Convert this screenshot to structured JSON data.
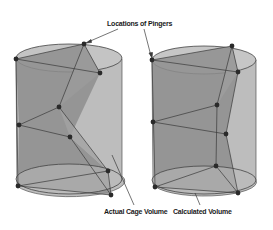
{
  "figure": {
    "labels": {
      "pingers": "Locations of Pingers",
      "actual": "Actual Cage Volume",
      "calculated": "Calculated Volume"
    },
    "colors": {
      "cylinder_light": "#c8c8c8",
      "cylinder_side": "#b4b4b4",
      "volume_dark": "#8a8a8a",
      "volume_mid": "#9c9c9c",
      "edge": "#3a3a3a",
      "pinger": "#2a2a2a"
    },
    "cylinders": [
      {
        "name": "actual-cage",
        "pinger_count": 9
      },
      {
        "name": "calculated",
        "pinger_count": 9
      }
    ]
  }
}
